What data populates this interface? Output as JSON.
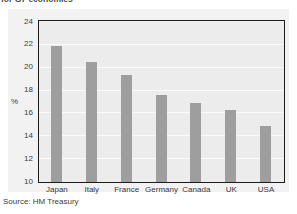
{
  "title_clipped": "for G7 economies",
  "source_note": "Source: HM Treasury",
  "chart_data": {
    "type": "bar",
    "title": "for G7 economies",
    "categories": [
      "Japan",
      "Italy",
      "France",
      "Germany",
      "Canada",
      "UK",
      "USA"
    ],
    "values": [
      21.9,
      20.5,
      19.4,
      17.6,
      16.9,
      16.3,
      14.9
    ],
    "series": [
      {
        "name": "Share",
        "values": [
          21.9,
          20.5,
          19.4,
          17.6,
          16.9,
          16.3,
          14.9
        ]
      }
    ],
    "xlabel": "",
    "ylabel": "%",
    "ylim": [
      10,
      24
    ],
    "yticks": [
      10,
      12,
      14,
      16,
      18,
      20,
      22,
      24
    ],
    "ytick_labels": [
      "10",
      "12",
      "14",
      "16",
      "18",
      "20",
      "22",
      "24"
    ],
    "grid": true,
    "legend": false,
    "bar_color": "#9e9e9e",
    "plot_bg_color": "#ececec",
    "figure_bg_color": "#f2f2f2",
    "axis_color": "#1c1c1c"
  }
}
